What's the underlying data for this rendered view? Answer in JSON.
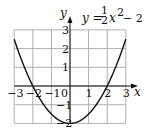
{
  "chart_data": {
    "type": "line",
    "title": "",
    "equation": "y = 1/2 x^2 - 2",
    "equation_parts": {
      "lhs": "y =",
      "num": "1",
      "den": "2",
      "rhs": "x",
      "exp": "2",
      "tail": "− 2"
    },
    "xlabel": "x",
    "ylabel": "y",
    "xlim": [
      -3,
      3
    ],
    "ylim": [
      -2,
      3
    ],
    "grid": true,
    "x_ticks": [
      -3,
      -2,
      -1,
      1,
      2,
      3
    ],
    "x_tick_labels": [
      "−3",
      "−2",
      "−1",
      "1",
      "2",
      "3"
    ],
    "y_ticks": [
      3,
      2,
      1,
      -1,
      -2
    ],
    "y_tick_labels": [
      "3",
      "2",
      "1",
      "−1",
      "−2"
    ],
    "origin_label": "0",
    "series": [
      {
        "name": "y = 1/2 x^2 - 2",
        "x": [
          -3,
          -2.5,
          -2,
          -1.5,
          -1,
          -0.5,
          0,
          0.5,
          1,
          1.5,
          2,
          2.5,
          3
        ],
        "y": [
          2.5,
          1.125,
          0,
          -0.875,
          -1.5,
          -1.875,
          -2,
          -1.875,
          -1.5,
          -0.875,
          0,
          1.125,
          2.5
        ]
      }
    ]
  }
}
